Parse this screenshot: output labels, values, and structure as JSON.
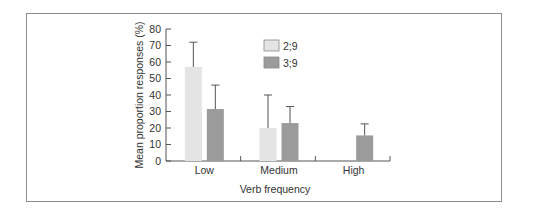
{
  "chart_data": {
    "type": "bar",
    "title": "",
    "xlabel": "Verb frequency",
    "ylabel": "Mean proportion responses (%)",
    "ylim": [
      0,
      80
    ],
    "yticks": [
      0,
      10,
      20,
      30,
      40,
      50,
      60,
      70,
      80
    ],
    "categories": [
      "Low",
      "Medium",
      "High"
    ],
    "series": [
      {
        "name": "2;9",
        "color": "#e4e4e4",
        "values": [
          57,
          20,
          0
        ],
        "error_upper": [
          72,
          40,
          null
        ]
      },
      {
        "name": "3;9",
        "color": "#9b9b9b",
        "values": [
          31.5,
          23,
          15.5
        ],
        "error_upper": [
          46,
          33,
          22.5
        ]
      }
    ],
    "legend_position": "upper center",
    "grid": false
  },
  "labels": {
    "xlabel": "Verb frequency",
    "ylabel": "Mean proportion responses (%)",
    "legend": [
      "2;9",
      "3;9"
    ],
    "categories": [
      "Low",
      "Medium",
      "High"
    ],
    "yticks": [
      "0",
      "10",
      "20",
      "30",
      "40",
      "50",
      "60",
      "70",
      "80"
    ]
  }
}
